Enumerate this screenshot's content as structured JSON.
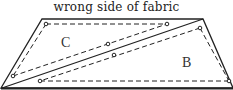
{
  "title": "wrong side of fabric",
  "pieces": [
    {
      "label": "C",
      "x": 68,
      "y": 47
    },
    {
      "label": "B",
      "x": 187,
      "y": 67
    }
  ],
  "colors": {
    "stroke": "#222222",
    "background": "#ffffff"
  }
}
